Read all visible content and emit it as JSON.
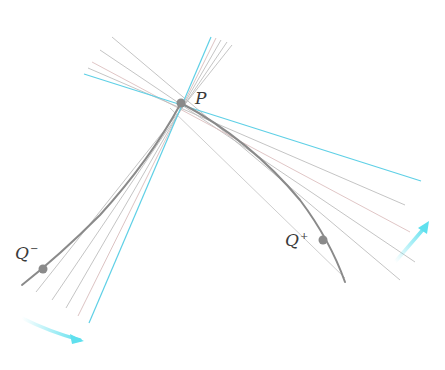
{
  "diagram": {
    "points": {
      "P": {
        "label": "P",
        "x": 181,
        "y": 103
      },
      "Q_minus": {
        "label": "Q",
        "sup": "−",
        "x": 43,
        "y": 269
      },
      "Q_plus": {
        "label": "Q",
        "sup": "+",
        "x": 323,
        "y": 240
      }
    },
    "colors": {
      "background": "#ffffff",
      "secant_line": "#b8b8b8",
      "secant_line_pink": "#e0b8b8",
      "tangent_line": "#5fd0e6",
      "curve": "#8a8a8a",
      "point": "#8a8a8a",
      "arrow": "#5fe0ee",
      "label": "#3a3a3a"
    },
    "tangent_lines": [
      {
        "name": "left-tangent",
        "x1": 84,
        "y1": 74,
        "x2": 421,
        "y2": 181
      },
      {
        "name": "steep-tangent",
        "x1": 211,
        "y1": 37,
        "x2": 89,
        "y2": 323
      }
    ],
    "secant_lines_upper_left": [
      {
        "x1": 112,
        "y1": 37,
        "x2": 420,
        "y2": 258
      },
      {
        "x1": 100,
        "y1": 50,
        "x2": 418,
        "y2": 240
      },
      {
        "x1": 92,
        "y1": 62,
        "x2": 416,
        "y2": 222
      },
      {
        "x1": 88,
        "y1": 68,
        "x2": 416,
        "y2": 204
      }
    ],
    "secant_lines_upper_right": [
      {
        "x1": 216,
        "y1": 38,
        "x2": 73,
        "y2": 313
      },
      {
        "x1": 221,
        "y1": 40,
        "x2": 60,
        "y2": 305
      },
      {
        "x1": 227,
        "y1": 42,
        "x2": 48,
        "y2": 292
      }
    ],
    "arrows": [
      {
        "name": "lower-left-arrow",
        "from": [
          22,
          318
        ],
        "to": [
          80,
          340
        ]
      },
      {
        "name": "lower-right-arrow",
        "from": [
          397,
          262
        ],
        "to": [
          428,
          224
        ]
      }
    ],
    "labels": {
      "p": "P",
      "q_minus_base": "Q",
      "q_minus_sup": "−",
      "q_plus_base": "Q",
      "q_plus_sup": "+"
    }
  }
}
